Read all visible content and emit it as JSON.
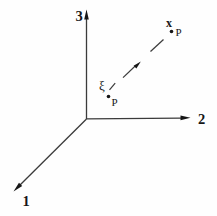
{
  "figure": {
    "background": "#fefefe",
    "line_color": "#3b3b3b",
    "ink_color": "#161616",
    "axes": [
      {
        "label": "1"
      },
      {
        "label": "2"
      },
      {
        "label": "3"
      }
    ],
    "points": [
      {
        "symbol": "ξ",
        "subscript": "P"
      },
      {
        "symbol": "x",
        "subscript": "P"
      }
    ]
  }
}
